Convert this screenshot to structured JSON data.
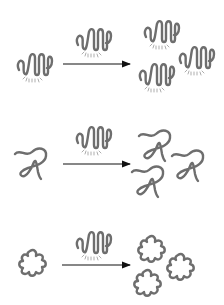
{
  "diagram": {
    "colors": {
      "shape_stroke": "#6e6e6e",
      "glow_marks": "#8a8a8a",
      "arrow": "#111111",
      "background": "#ffffff"
    },
    "rows": [
      {
        "id": "row-1",
        "substrate_shape": "coil-with-glow",
        "catalyst_shape": "coil-with-glow",
        "product_shape": "coil-with-glow",
        "product_count": 3
      },
      {
        "id": "row-2",
        "substrate_shape": "loop-strand",
        "catalyst_shape": "coil-with-glow",
        "product_shape": "loop-strand",
        "product_count": 3
      },
      {
        "id": "row-3",
        "substrate_shape": "flower-blob",
        "catalyst_shape": "coil-with-glow",
        "product_shape": "flower-blob",
        "product_count": 3
      }
    ]
  }
}
